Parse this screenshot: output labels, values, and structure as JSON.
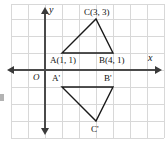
{
  "figure": {
    "type": "coordinate-plane-diagram",
    "axes": {
      "x_label": "x",
      "y_label": "y",
      "origin_label": "O"
    },
    "grid": {
      "visible": true,
      "spacing_px": 17,
      "color": "#d8d8d8"
    },
    "colors": {
      "grid": "#d8d8d8",
      "axis": "#4a4a4a",
      "shape_stroke": "#1a1a1a",
      "text": "#111111",
      "background": "#ffffff"
    },
    "points": [
      {
        "name": "A",
        "label": "A(1, 1)",
        "x": 1,
        "y": 1,
        "px": 62,
        "py": 53
      },
      {
        "name": "B",
        "label": "B(4, 1)",
        "x": 4,
        "y": 1,
        "px": 113,
        "py": 53
      },
      {
        "name": "C",
        "label": "C(3, 3)",
        "x": 3,
        "y": 3,
        "px": 96,
        "py": 19
      },
      {
        "name": "A'",
        "label": "A'",
        "x": 1,
        "y": -1,
        "px": 62,
        "py": 87
      },
      {
        "name": "B'",
        "label": "B'",
        "x": 4,
        "y": -1,
        "px": 113,
        "py": 87
      },
      {
        "name": "C'",
        "label": "C'",
        "x": 3,
        "y": -3,
        "px": 96,
        "py": 121
      }
    ],
    "polygons": [
      {
        "name": "triangle-ABC",
        "vertices": "62,53 113,53 96,19",
        "label": "ABC"
      },
      {
        "name": "triangle-A'B'C'",
        "vertices": "62,87 113,87 96,121",
        "label": "A'B'C'"
      }
    ]
  }
}
